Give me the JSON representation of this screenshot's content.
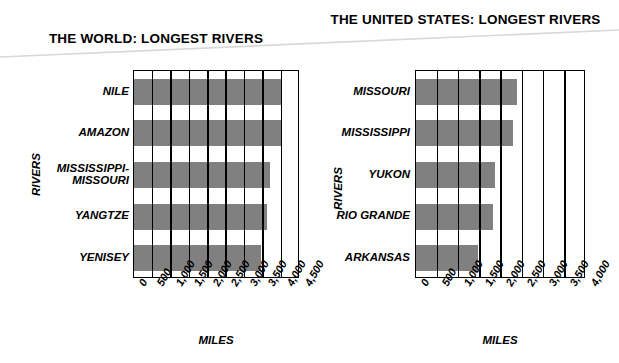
{
  "chart_data": [
    {
      "type": "bar",
      "orientation": "horizontal",
      "title": "THE WORLD: LONGEST RIVERS",
      "xlabel": "MILES",
      "ylabel": "RIVERS",
      "categories": [
        "NILE",
        "AMAZON",
        "MISSISSIPPI-\nMISSOURI",
        "YANGTZE",
        "YENISEY"
      ],
      "values": [
        4000,
        4000,
        3700,
        3600,
        3450
      ],
      "xlim": [
        0,
        4500
      ],
      "xticks": [
        "0",
        "500",
        "1,000",
        "1,500",
        "2,000",
        "2,500",
        "3,000",
        "3,500",
        "4,000",
        "4,500"
      ],
      "grid": true,
      "legend": false,
      "bar_color": "#808080",
      "axis_color": "#000000"
    },
    {
      "type": "bar",
      "orientation": "horizontal",
      "title": "THE UNITED STATES:\nLONGEST RIVERS",
      "xlabel": "MILES",
      "ylabel": "RIVERS",
      "categories": [
        "MISSOURI",
        "MISSISSIPPI",
        "YUKON",
        "RIO GRANDE",
        "ARKANSAS"
      ],
      "values": [
        2370,
        2280,
        1850,
        1810,
        1460
      ],
      "xlim": [
        0,
        4000
      ],
      "xticks": [
        "0",
        "500",
        "1,000",
        "1,500",
        "2,000",
        "2,500",
        "3,000",
        "3,500",
        "4,000"
      ],
      "grid": true,
      "legend": false,
      "bar_color": "#808080",
      "axis_color": "#000000"
    }
  ]
}
